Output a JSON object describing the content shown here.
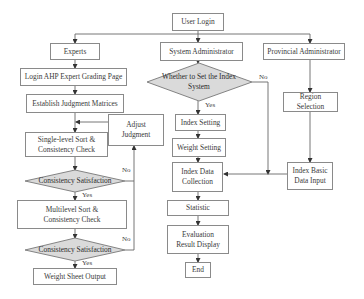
{
  "diagram": {
    "type": "flowchart",
    "nodes": {
      "user_login": "User Login",
      "experts": "Experts",
      "system_admin": "System Administrator",
      "provincial_admin": "Provincial Administrator",
      "login_ahp": "Login AHP Expert Grading Page",
      "establish_matrices": "Establish Judgment Matrices",
      "single_level": "Single-level Sort & Consistency Check",
      "adjust_judgment": "Adjust Judgment",
      "consistency_1": "Consistency Satisfaction",
      "multilevel": "Multilevel Sort & Consistency Check",
      "consistency_2": "Consistency Satisfaction",
      "weight_sheet_output": "Weight Sheet Output",
      "set_index_system": "Whether to Set the Index System",
      "index_setting": "Index Setting",
      "weight_setting": "Weight Setting",
      "index_data_collection": "Index Data Collection",
      "statistic": "Statistic",
      "evaluation_display": "Evaluation Result Display",
      "end": "End",
      "region_selection": "Region Selection",
      "index_basic_input": "Index Basic Data Input"
    },
    "edge_labels": {
      "yes": "Yes",
      "no": "No"
    },
    "colors": {
      "box_border": "#8a8a8a",
      "diamond_fill": "#d9d9d9",
      "line": "#555555"
    }
  }
}
